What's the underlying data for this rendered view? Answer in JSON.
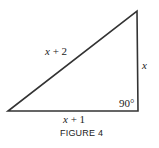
{
  "figure": {
    "caption": "FIGURE 4",
    "shape": "right-triangle",
    "line_color": "#333333",
    "vertices": {
      "bottom_left": [
        8,
        111
      ],
      "bottom_right": [
        138,
        111
      ],
      "top_right": [
        137,
        11
      ]
    },
    "labels": {
      "hypotenuse": "x + 2",
      "vertical_leg": "x",
      "base": "x + 1",
      "right_angle": "90°"
    }
  }
}
